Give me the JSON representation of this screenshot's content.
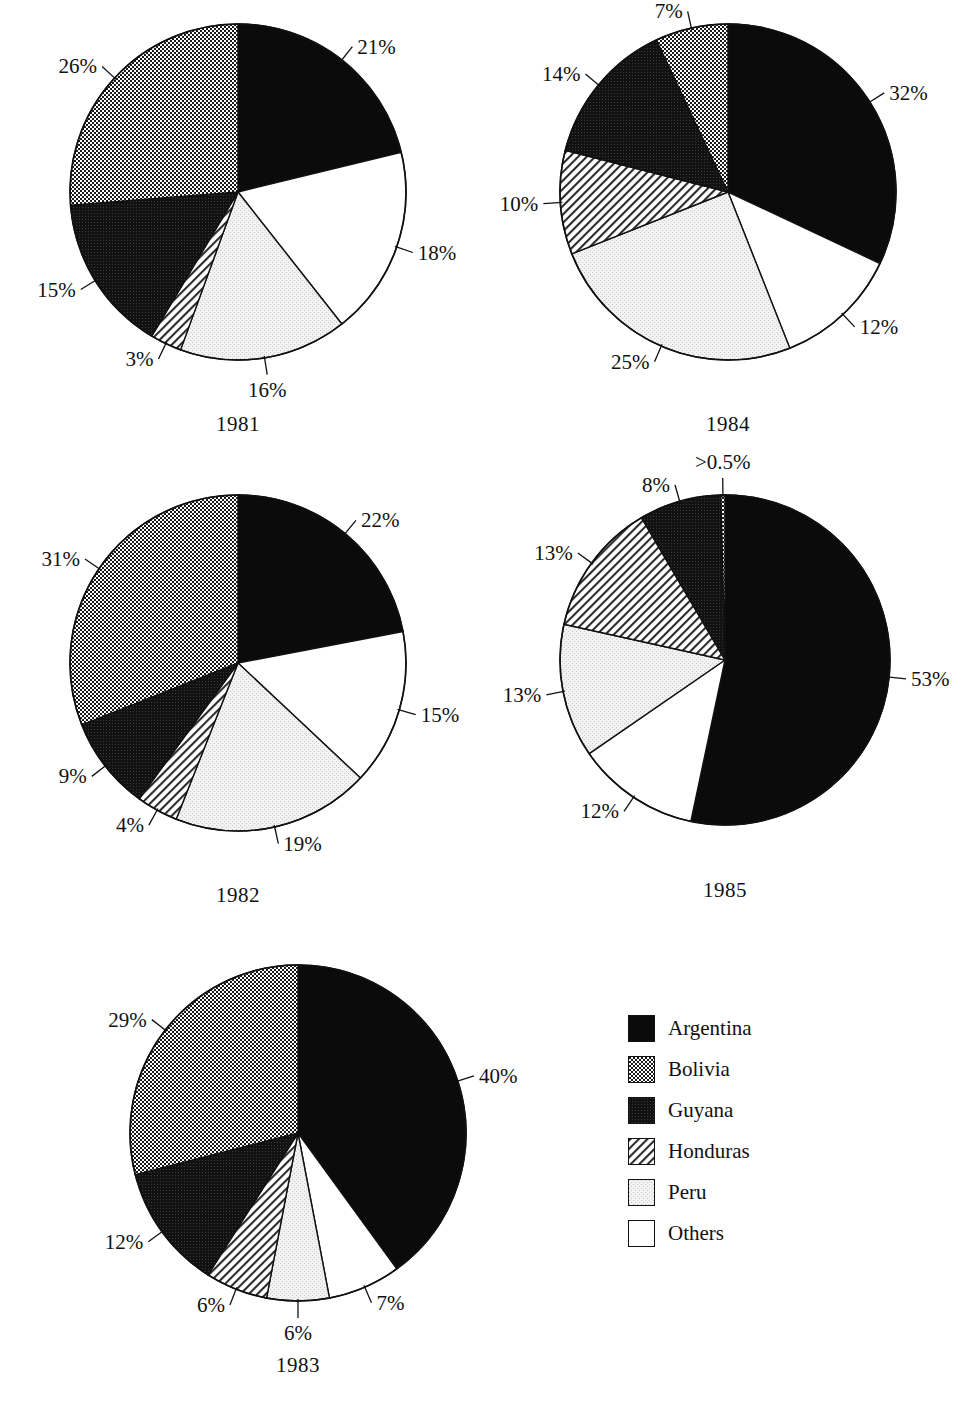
{
  "legend": {
    "items": [
      {
        "label": "Argentina",
        "key": "argentina",
        "fill": "#0d0d0d"
      },
      {
        "label": "Bolivia",
        "key": "bolivia",
        "fill": "#b0b0b0"
      },
      {
        "label": "Guyana",
        "key": "guyana",
        "fill": "#161616"
      },
      {
        "label": "Honduras",
        "key": "honduras",
        "fill": "#d8d8d8"
      },
      {
        "label": "Peru",
        "key": "peru",
        "fill": "#ececec"
      },
      {
        "label": "Others",
        "key": "others",
        "fill": "#ffffff"
      }
    ]
  },
  "chart_data": [
    {
      "type": "pie",
      "title": "1981",
      "labels": [
        "Argentina",
        "Others",
        "Peru",
        "Honduras",
        "Guyana",
        "Bolivia"
      ],
      "keys": [
        "argentina",
        "others",
        "peru",
        "honduras",
        "guyana",
        "bolivia"
      ],
      "values": [
        21,
        18,
        16,
        3,
        15,
        26
      ],
      "value_labels": [
        "21%",
        "18%",
        "16%",
        "3%",
        "15%",
        "26%"
      ],
      "start_angle": 0
    },
    {
      "type": "pie",
      "title": "1984",
      "labels": [
        "Argentina",
        "Others",
        "Peru",
        "Honduras",
        "Guyana",
        "Bolivia"
      ],
      "keys": [
        "argentina",
        "others",
        "peru",
        "honduras",
        "guyana",
        "bolivia"
      ],
      "values": [
        32,
        12,
        25,
        10,
        14,
        7
      ],
      "value_labels": [
        "32%",
        "12%",
        "25%",
        "10%",
        "14%",
        "7%"
      ],
      "start_angle": 0
    },
    {
      "type": "pie",
      "title": "1982",
      "labels": [
        "Argentina",
        "Others",
        "Peru",
        "Honduras",
        "Guyana",
        "Bolivia"
      ],
      "keys": [
        "argentina",
        "others",
        "peru",
        "honduras",
        "guyana",
        "bolivia"
      ],
      "values": [
        22,
        15,
        19,
        4,
        9,
        31
      ],
      "value_labels": [
        "22%",
        "15%",
        "19%",
        "4%",
        "9%",
        "31%"
      ],
      "start_angle": 0
    },
    {
      "type": "pie",
      "title": "1985",
      "labels": [
        "Argentina",
        "Others",
        "Peru",
        "Honduras",
        "Guyana",
        "Bolivia"
      ],
      "keys": [
        "argentina",
        "others",
        "peru",
        "honduras",
        "guyana",
        "bolivia"
      ],
      "values": [
        53,
        12,
        13,
        13,
        8,
        0.4
      ],
      "value_labels": [
        "53%",
        "12%",
        "13%",
        "13%",
        "8%",
        ">0.5%"
      ],
      "start_angle": 0
    },
    {
      "type": "pie",
      "title": "1983",
      "labels": [
        "Argentina",
        "Others",
        "Peru",
        "Honduras",
        "Guyana",
        "Bolivia"
      ],
      "keys": [
        "argentina",
        "others",
        "peru",
        "honduras",
        "guyana",
        "bolivia"
      ],
      "values": [
        40,
        7,
        6,
        6,
        12,
        29
      ],
      "value_labels": [
        "40%",
        "7%",
        "6%",
        "6%",
        "12%",
        "29%"
      ],
      "start_angle": 0
    }
  ],
  "layout": {
    "pies": [
      {
        "index": 0,
        "left": 70,
        "top": 24,
        "radius": 168,
        "year_top": 400
      },
      {
        "index": 1,
        "left": 560,
        "top": 24,
        "radius": 168,
        "year_top": 400
      },
      {
        "index": 2,
        "left": 70,
        "top": 495,
        "radius": 168,
        "year_top": 400
      },
      {
        "index": 3,
        "left": 560,
        "top": 495,
        "radius": 165,
        "year_top": 395
      },
      {
        "index": 4,
        "left": 130,
        "top": 965,
        "radius": 168,
        "year_top": 400
      }
    ]
  }
}
